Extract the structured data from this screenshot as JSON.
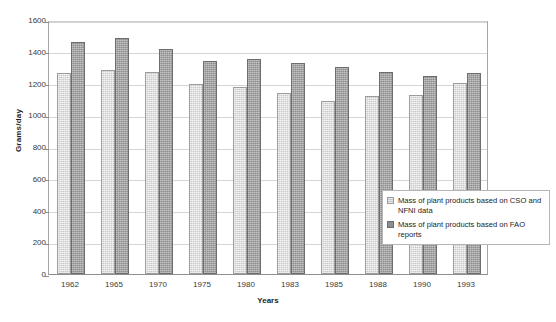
{
  "chart_data": {
    "type": "bar",
    "title": "",
    "xlabel": "Years",
    "ylabel": "Grams/day",
    "ylim": [
      0,
      1600
    ],
    "yticks": [
      0,
      200,
      400,
      600,
      800,
      1000,
      1200,
      1400,
      1600
    ],
    "grid": true,
    "legend_position": "inside-right",
    "categories": [
      "1962",
      "1965",
      "1970",
      "1975",
      "1980",
      "1983",
      "1985",
      "1988",
      "1990",
      "1993"
    ],
    "series": [
      {
        "name": "Mass of plant products based on CSO and NFNI data",
        "color": "#c9c9c9",
        "values": [
          1265,
          1285,
          1275,
          1200,
          1175,
          1140,
          1090,
          1120,
          1125,
          1205
        ]
      },
      {
        "name": "Mass of plant products based on FAO reports",
        "color": "#8d8d8d",
        "values": [
          1460,
          1485,
          1415,
          1340,
          1355,
          1330,
          1305,
          1270,
          1250,
          1265
        ]
      }
    ]
  },
  "legend": {
    "entries": [
      {
        "label": "Mass of plant products based on CSO and NFNI data",
        "swatch": "light-swatch-icon"
      },
      {
        "label": "Mass of plant products based on FAO reports",
        "swatch": "dark-swatch-icon"
      }
    ]
  }
}
